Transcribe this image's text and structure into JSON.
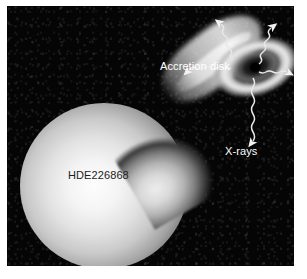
{
  "figure": {
    "background_color": "#050505",
    "frame": {
      "x": 7,
      "y": 6,
      "width": 287,
      "height": 260
    }
  },
  "labels": {
    "accretion_disk": "Accretion disk",
    "xrays": "X-rays",
    "star": "HDE226868"
  },
  "objects": {
    "star": {
      "name": "HDE226868",
      "type": "supergiant-star",
      "color": "#fdfdfd"
    },
    "gas_stream": {
      "name": "gas-stream",
      "type": "accretion-stream",
      "color": "#ececec"
    },
    "accretion_disk": {
      "name": "Accretion disk",
      "type": "accretion-disk",
      "color": "#ececec"
    },
    "black_hole": {
      "name": "black-hole",
      "type": "compact-object",
      "color": "#000000"
    }
  },
  "emission": {
    "name": "X-rays",
    "color": "#ffffff",
    "arrows": [
      {
        "id": "ray-upper-left",
        "direction": "up-left"
      },
      {
        "id": "ray-upper-right",
        "direction": "up-right"
      },
      {
        "id": "ray-left",
        "direction": "down-left"
      },
      {
        "id": "ray-right",
        "direction": "right"
      },
      {
        "id": "ray-down",
        "direction": "down"
      }
    ]
  }
}
